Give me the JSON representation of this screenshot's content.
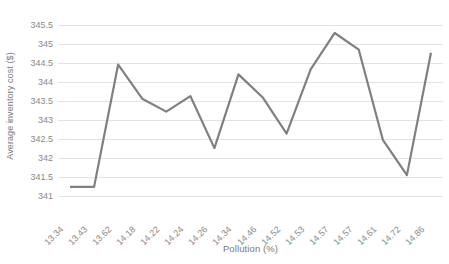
{
  "chart_data": {
    "type": "line",
    "title": "",
    "xlabel": "Pollution (%)",
    "ylabel": "Average inventory cost ($)",
    "categories": [
      "13.34",
      "13.43",
      "13.62",
      "14.18",
      "14.22",
      "14.24",
      "14.26",
      "14.34",
      "14.46",
      "14.52",
      "14.53",
      "14.57",
      "14.57",
      "14.61",
      "14.72",
      "14.86"
    ],
    "values": [
      341.24,
      341.24,
      344.46,
      343.56,
      343.22,
      343.63,
      342.26,
      344.2,
      343.6,
      342.64,
      344.33,
      345.29,
      344.85,
      342.48,
      341.55,
      344.77
    ],
    "series": [
      {
        "name": "Average inventory cost",
        "values": [
          341.24,
          341.24,
          344.46,
          343.56,
          343.22,
          343.63,
          342.26,
          344.2,
          343.6,
          342.64,
          344.33,
          345.29,
          344.85,
          342.48,
          341.55,
          344.77
        ]
      }
    ],
    "ylim": [
      341,
      345.5
    ],
    "ytick_labels": [
      "345.5",
      "345",
      "344.5",
      "344",
      "343.5",
      "343",
      "342.5",
      "342",
      "341.5",
      "341"
    ],
    "ytick_values": [
      345.5,
      345,
      344.5,
      344,
      343.5,
      343,
      342.5,
      342,
      341.5,
      341
    ],
    "grid": true,
    "legend": false,
    "legend_position": "none",
    "line_color": "#808080",
    "gridline_color": "#e3e3e3",
    "text_color": "#8a8a8a",
    "background_color": "#ffffff"
  }
}
